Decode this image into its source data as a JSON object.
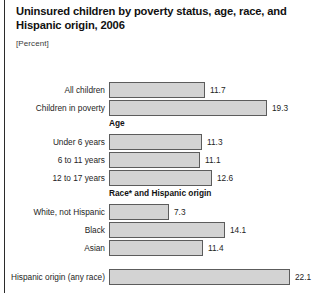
{
  "header": {
    "title": "Uninsured children by poverty status, age, race, and Hispanic origin, 2006",
    "subtitle": "[Percent]"
  },
  "chart_data": {
    "type": "bar",
    "orientation": "horizontal",
    "title": "Uninsured children by poverty status, age, race, and Hispanic origin, 2006",
    "subtitle": "[Percent]",
    "xlabel": "",
    "ylabel": "",
    "xlim": [
      0,
      22.1
    ],
    "grid": false,
    "legend": null,
    "bar_color": "#d3d3d3",
    "bar_border_color": "#5c5c5c",
    "categories": [
      "All children",
      "Children in poverty",
      "Under 6 years",
      "6 to 11 years",
      "12 to 17 years",
      "White, not Hispanic",
      "Black",
      "Asian",
      "Hispanic origin (any race)"
    ],
    "values": [
      11.7,
      19.3,
      11.3,
      11.1,
      12.6,
      7.3,
      14.1,
      11.4,
      22.1
    ],
    "value_labels": [
      "11.7",
      "19.3",
      "11.3",
      "11.1",
      "12.6",
      "7.3",
      "14.1",
      "11.4",
      "22.1"
    ],
    "group_headers": [
      "Age",
      "Race* and Hispanic origin"
    ],
    "groups": [
      {
        "header": null,
        "categories": [
          "All children",
          "Children in poverty"
        ],
        "values": [
          11.7,
          19.3
        ]
      },
      {
        "header": "Age",
        "categories": [
          "Under 6 years",
          "6 to 11 years",
          "12 to 17 years"
        ],
        "values": [
          11.3,
          11.1,
          12.6
        ]
      },
      {
        "header": "Race* and Hispanic origin",
        "categories": [
          "White, not Hispanic",
          "Black",
          "Asian"
        ],
        "values": [
          7.3,
          14.1,
          11.4
        ]
      },
      {
        "header": null,
        "categories": [
          "Hispanic origin (any race)"
        ],
        "values": [
          22.1
        ]
      }
    ]
  },
  "rows": [
    {
      "label": "All children",
      "value": "11.7",
      "top": 3,
      "width": 96
    },
    {
      "label": "Children in poverty",
      "value": "19.3",
      "top": 21,
      "width": 158
    },
    {
      "label": "Under 6 years",
      "value": "11.3",
      "top": 55,
      "width": 93
    },
    {
      "label": "6 to 11 years",
      "value": "11.1",
      "top": 73,
      "width": 91
    },
    {
      "label": "12 to 17 years",
      "value": "12.6",
      "top": 91,
      "width": 103
    },
    {
      "label": "White, not Hispanic",
      "value": "7.3",
      "top": 125,
      "width": 60
    },
    {
      "label": "Black",
      "value": "14.1",
      "top": 143,
      "width": 116
    },
    {
      "label": "Asian",
      "value": "11.4",
      "top": 161,
      "width": 94
    },
    {
      "label": "Hispanic origin (any race)",
      "value": "22.1",
      "top": 190,
      "width": 181
    }
  ],
  "group_heads": [
    {
      "text": "Age",
      "top": 40
    },
    {
      "text": "Race* and Hispanic origin",
      "top": 110
    }
  ]
}
